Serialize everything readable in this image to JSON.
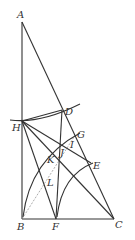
{
  "diagram": {
    "type": "geometric-construction",
    "points": {
      "A": {
        "label": "A",
        "x": 22,
        "y": 22
      },
      "B": {
        "label": "B",
        "x": 22,
        "y": 219
      },
      "C": {
        "label": "C",
        "x": 114,
        "y": 219
      },
      "D": {
        "label": "D",
        "x": 62,
        "y": 110
      },
      "E": {
        "label": "E",
        "x": 91,
        "y": 163
      },
      "F": {
        "label": "F",
        "x": 56,
        "y": 219
      },
      "G": {
        "label": "G",
        "x": 76,
        "y": 133
      },
      "H": {
        "label": "H",
        "x": 22,
        "y": 121
      },
      "I": {
        "label": "I",
        "x": 71,
        "y": 143
      },
      "J": {
        "label": "J",
        "x": 62,
        "y": 151
      },
      "K": {
        "label": "K",
        "x": 59,
        "y": 157
      },
      "L": {
        "label": "L",
        "x": 48,
        "y": 180
      }
    },
    "labels": {
      "A": "A",
      "B": "B",
      "C": "C",
      "D": "D",
      "E": "E",
      "F": "F",
      "G": "G",
      "H": "H",
      "I": "I",
      "J": "J",
      "K": "K",
      "L": "L"
    }
  }
}
